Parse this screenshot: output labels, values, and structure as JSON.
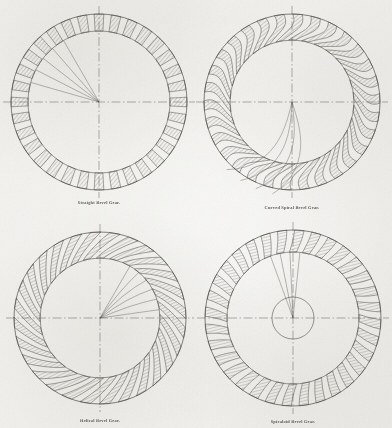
{
  "plate": {
    "title": "Bevel Gear Tooth Forms",
    "width": 392,
    "height": 428,
    "paper_color": "#f2f1ee",
    "ink_color": "#4a4740",
    "hatch_color": "#6b6760"
  },
  "figures": [
    {
      "id": "straight-bevel-gear",
      "caption": "Straight Bevel Gear.",
      "cx": 99,
      "cy": 102,
      "r_outer": 88,
      "r_rim": 71,
      "r_hub": 0,
      "teeth": 32,
      "tooth_span": 0.56,
      "skew": 0.0,
      "curve": 0.0,
      "caption_x": 99,
      "caption_y": 200,
      "centerline": true,
      "trace_lines": {
        "count": 5,
        "type": "straight",
        "start_angle": 196,
        "end_angle": 240,
        "radius": 71
      }
    },
    {
      "id": "curved-spiral-bevel-gear",
      "caption": "Curved Spiral Bevel Gear.",
      "cx": 292,
      "cy": 102,
      "r_outer": 88,
      "r_rim": 62,
      "r_hub": 0,
      "teeth": 30,
      "tooth_span": 0.52,
      "skew": 0.6,
      "curve": 0.42,
      "caption_x": 292,
      "caption_y": 205,
      "centerline": true,
      "trace_lines": {
        "count": 4,
        "type": "spiral",
        "start_angle": 72,
        "end_angle": 104,
        "radius": 94
      }
    },
    {
      "id": "helical-bevel-gear",
      "caption": "Helical Bevel Gear.",
      "cx": 100,
      "cy": 318,
      "r_outer": 86,
      "r_rim": 60,
      "r_hub": 0,
      "teeth": 28,
      "tooth_span": 0.54,
      "skew": 0.88,
      "curve": 0.1,
      "caption_x": 100,
      "caption_y": 418,
      "centerline": true,
      "trace_lines": {
        "count": 6,
        "type": "tangent-fan",
        "start_angle": 300,
        "end_angle": 352,
        "radius": 60
      }
    },
    {
      "id": "spiraloid-bevel-gear",
      "caption": "Spiraloid Bevel Gear.",
      "cx": 293,
      "cy": 318,
      "r_outer": 88,
      "r_rim": 66,
      "r_hub": 21,
      "teeth": 32,
      "tooth_span": 0.55,
      "skew": 0.16,
      "curve": 0.05,
      "caption_x": 293,
      "caption_y": 419,
      "centerline": true,
      "trace_lines": {
        "count": 4,
        "type": "straight",
        "start_angle": 250,
        "end_angle": 276,
        "radius": 66
      }
    }
  ]
}
